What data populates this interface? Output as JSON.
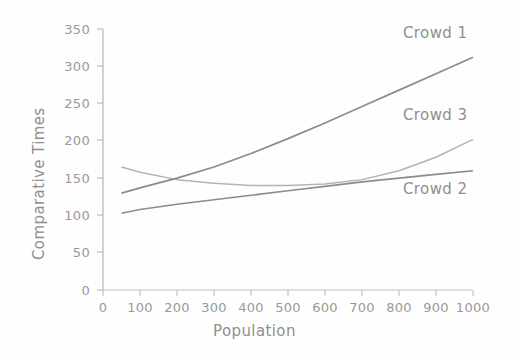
{
  "chart_data": {
    "type": "line",
    "title": "",
    "xlabel": "Population",
    "ylabel": "Comparative Times",
    "xlim": [
      0,
      1000
    ],
    "ylim": [
      0,
      350
    ],
    "xticks": [
      0,
      100,
      200,
      300,
      400,
      500,
      600,
      700,
      800,
      900,
      1000
    ],
    "yticks": [
      0,
      50,
      100,
      150,
      200,
      250,
      300,
      350
    ],
    "grid": false,
    "legend": "inline-series-labels",
    "x": [
      50,
      100,
      200,
      300,
      400,
      500,
      600,
      700,
      800,
      900,
      1000
    ],
    "series": [
      {
        "name": "Crowd 1",
        "label": "Crowd 1",
        "color": "#8c8c8c",
        "values": [
          130,
          137,
          150,
          165,
          183,
          203,
          224,
          246,
          268,
          290,
          312
        ]
      },
      {
        "name": "Crowd 2",
        "label": "Crowd 2",
        "color": "#8c8c8c",
        "values": [
          103,
          108,
          115,
          121,
          127,
          133,
          139,
          145,
          150,
          155,
          160
        ]
      },
      {
        "name": "Crowd 3",
        "label": "Crowd 3",
        "color": "#b3b3b3",
        "values": [
          165,
          158,
          148,
          143,
          140,
          140,
          142,
          148,
          160,
          178,
          202
        ]
      }
    ],
    "annotations": [
      {
        "text": "Crowd 1",
        "x": 820,
        "y": 336
      },
      {
        "text": "Crowd 3",
        "x": 820,
        "y": 232
      },
      {
        "text": "Crowd 2",
        "x": 820,
        "y": 122
      }
    ]
  },
  "axes": {
    "y_title": "Comparative Times",
    "x_title": "Population",
    "y_tick_labels": [
      "350",
      "300",
      "250",
      "200",
      "150",
      "100",
      "50",
      "0"
    ],
    "x_tick_labels": [
      "0",
      "100",
      "200",
      "300",
      "400",
      "500",
      "600",
      "700",
      "800",
      "900",
      "1000"
    ]
  },
  "labels": {
    "crowd1": "Crowd 1",
    "crowd2": "Crowd 2",
    "crowd3": "Crowd 3"
  },
  "colors": {
    "line_dark": "#8c8c8c",
    "line_light": "#b3b3b3",
    "axis": "#b0b0b0",
    "text": "#909090",
    "background": "#fefefe"
  }
}
